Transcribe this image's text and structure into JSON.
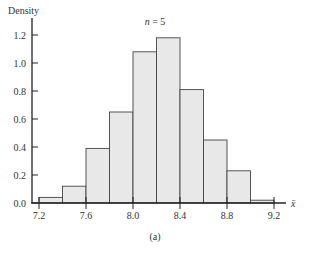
{
  "chart_data": {
    "type": "bar",
    "title": "n = 5",
    "title_var": "n",
    "title_value": "5",
    "xlabel": "x̄",
    "ylabel": "Density",
    "caption": "(a)",
    "bin_edges": [
      7.2,
      7.4,
      7.6,
      7.8,
      8.0,
      8.2,
      8.4,
      8.6,
      8.8,
      9.0,
      9.2
    ],
    "categories": [
      "7.2-7.4",
      "7.4-7.6",
      "7.6-7.8",
      "7.8-8.0",
      "8.0-8.2",
      "8.2-8.4",
      "8.4-8.6",
      "8.6-8.8",
      "8.8-9.0",
      "9.0-9.2"
    ],
    "values": [
      0.04,
      0.12,
      0.39,
      0.65,
      1.08,
      1.18,
      0.81,
      0.45,
      0.23,
      0.02
    ],
    "xticks": [
      "7.2",
      "7.6",
      "8.0",
      "8.4",
      "8.8",
      "9.2"
    ],
    "yticks": [
      "0.0",
      "0.2",
      "0.4",
      "0.6",
      "0.8",
      "1.0",
      "1.2"
    ],
    "xlim": [
      7.14,
      9.4
    ],
    "ylim": [
      0,
      1.3
    ],
    "grid": false,
    "bar_fill": "#e8e8e8",
    "bar_edge": "#444444"
  }
}
